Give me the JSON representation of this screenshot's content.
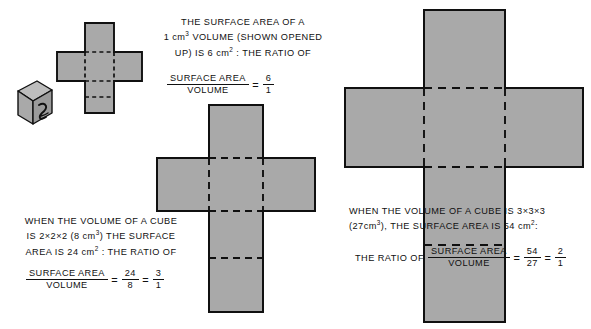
{
  "figure": {
    "background_color": "#ffffff",
    "fill_color": "#a9a9a9",
    "line_color": "#101010"
  },
  "cube": {
    "name": "unit-cube",
    "face_label": "2",
    "top_face_color": "#bcbcbc",
    "left_face_color": "#a9a9a9",
    "right_face_color": "#9a9a9a"
  },
  "blocks": {
    "one": {
      "lines": [
        "THE SURFACE AREA OF A",
        "1 cm³ VOLUME (SHOWN OPENED",
        "UP) IS 6 cm² : THE RATIO OF"
      ],
      "line1": "THE SURFACE AREA OF A",
      "line2_a": "1 cm",
      "line2_sup": "3",
      "line2_b": " VOLUME (SHOWN OPENED",
      "line3_a": "UP) IS 6 cm",
      "line3_sup": "2",
      "line3_b": " : THE RATIO OF",
      "fraction": {
        "numerator": "SURFACE AREA",
        "denominator": "VOLUME",
        "equals": "=",
        "result_num": "6",
        "result_den": "1"
      }
    },
    "two": {
      "line1": "WHEN THE VOLUME OF A CUBE",
      "line2_a": "IS  2×2×2  (8 cm",
      "line2_sup": "3",
      "line2_b": ") THE SURFACE",
      "line3_a": "AREA IS  24 cm",
      "line3_sup": "2",
      "line3_b": " : THE RATIO OF",
      "fraction": {
        "numerator": "SURFACE AREA",
        "denominator": "VOLUME",
        "equals1": "=",
        "mid_num": "24",
        "mid_den": "8",
        "equals2": "=",
        "result_num": "3",
        "result_den": "1"
      }
    },
    "three": {
      "line1": "WHEN  THE  VOLUME  OF  A  CUBE  IS  3×3×3",
      "line2_a": "(27cm",
      "line2_sup": "3",
      "line2_b": "),  THE  SURFACE  AREA  IS  54 cm",
      "line2_sup2": "2",
      "line2_c": ":",
      "lead": "THE RATIO OF",
      "fraction": {
        "numerator": "SURFACE AREA",
        "denominator": "VOLUME",
        "equals1": "=",
        "mid_num": "54",
        "mid_den": "27",
        "equals2": "=",
        "result_num": "2",
        "result_den": "1"
      }
    }
  },
  "nets": {
    "net1": {
      "label": "cube-net-1x1x1",
      "cell": 28
    },
    "net2": {
      "label": "cube-net-2x2x2",
      "cell": 53
    },
    "net3": {
      "label": "cube-net-3x3x3",
      "cell": 79
    }
  }
}
